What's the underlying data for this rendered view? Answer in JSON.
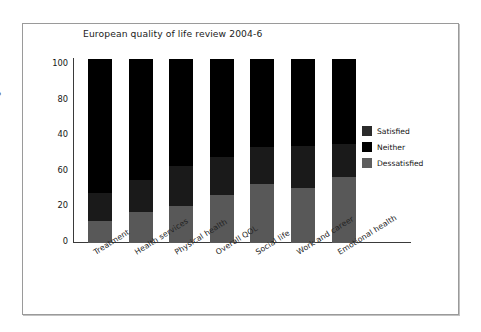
{
  "chart_data": {
    "type": "bar",
    "subtype": "stacked-bar",
    "title": "European quality of life review 2004-6",
    "xlabel": "",
    "ylabel": "Percentage",
    "ylim": [
      0,
      100
    ],
    "grid": false,
    "legend_position": "right",
    "y_tick_labels": [
      "100",
      "80",
      "40",
      "60",
      "20",
      "0"
    ],
    "y_tick_values": [
      100,
      80,
      60,
      40,
      20,
      0
    ],
    "categories": [
      "Treatment",
      "Health services",
      "Physical health",
      "Overall QOL",
      "Social life",
      "Work and career",
      "Emotional health"
    ],
    "series": [
      {
        "name": "Satisfied",
        "color": "#000000",
        "values": [
          73,
          66,
          58,
          53,
          48,
          47,
          46
        ]
      },
      {
        "name": "Neither",
        "color": "#1a1a1a",
        "values": [
          15,
          17,
          22,
          21,
          20,
          23,
          18
        ]
      },
      {
        "name": "Dessatisfied",
        "color": "#585858",
        "values": [
          12,
          17,
          20,
          26,
          32,
          30,
          36
        ]
      }
    ],
    "stack_order_bottom_to_top": [
      "Dessatisfied",
      "Neither",
      "Satisfied"
    ]
  },
  "legend": {
    "items": [
      {
        "label": "Satisfied",
        "color": "#2b2b2b"
      },
      {
        "label": "Neither",
        "color": "#000000"
      },
      {
        "label": "Dessatisfied",
        "color": "#5e5e5e"
      }
    ]
  }
}
